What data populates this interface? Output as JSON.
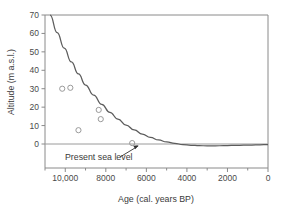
{
  "chart_data": {
    "type": "scatter",
    "title": "",
    "xlabel": "Age (cal. years BP)",
    "ylabel": "Altitude (m a.s.l.)",
    "xlim": [
      11000,
      0
    ],
    "ylim": [
      -8,
      70
    ],
    "x_reversed": true,
    "grid": false,
    "legend": null,
    "x_ticks": [
      10000,
      8000,
      6000,
      4000,
      2000,
      0
    ],
    "x_tick_labels": [
      "10,000",
      "8000",
      "6000",
      "4000",
      "2000",
      "0"
    ],
    "x_minor_ticks": [
      11000,
      9000,
      7000,
      5000,
      3000,
      1000
    ],
    "y_ticks": [
      0,
      10,
      20,
      30,
      40,
      50,
      60,
      70
    ],
    "y_tick_labels": [
      "0",
      "10",
      "20",
      "30",
      "40",
      "50",
      "60",
      "70"
    ],
    "series": [
      {
        "name": "Dated shoreline samples",
        "type": "scatter",
        "marker": "open-circle",
        "points": [
          {
            "x": 10150,
            "y": 30.0
          },
          {
            "x": 9750,
            "y": 30.5
          },
          {
            "x": 9350,
            "y": 7.5
          },
          {
            "x": 8350,
            "y": 18.5
          },
          {
            "x": 8250,
            "y": 13.5
          },
          {
            "x": 6700,
            "y": 0.5
          }
        ]
      },
      {
        "name": "Modelled relative sea-level curve",
        "type": "line",
        "points": [
          {
            "x": 10750,
            "y": 70.0
          },
          {
            "x": 10400,
            "y": 60.5
          },
          {
            "x": 10050,
            "y": 52.0
          },
          {
            "x": 9700,
            "y": 44.5
          },
          {
            "x": 9350,
            "y": 38.0
          },
          {
            "x": 9000,
            "y": 32.0
          },
          {
            "x": 8600,
            "y": 26.5
          },
          {
            "x": 8200,
            "y": 21.5
          },
          {
            "x": 7800,
            "y": 17.2
          },
          {
            "x": 7400,
            "y": 13.5
          },
          {
            "x": 7000,
            "y": 10.3
          },
          {
            "x": 6600,
            "y": 7.6
          },
          {
            "x": 6200,
            "y": 5.4
          },
          {
            "x": 5800,
            "y": 3.6
          },
          {
            "x": 5400,
            "y": 2.2
          },
          {
            "x": 5000,
            "y": 1.1
          },
          {
            "x": 4600,
            "y": 0.3
          },
          {
            "x": 4200,
            "y": -0.3
          },
          {
            "x": 3800,
            "y": -0.7
          },
          {
            "x": 3400,
            "y": -0.9
          },
          {
            "x": 3000,
            "y": -1.0
          },
          {
            "x": 2600,
            "y": -1.0
          },
          {
            "x": 2200,
            "y": -0.9
          },
          {
            "x": 1800,
            "y": -0.8
          },
          {
            "x": 1400,
            "y": -0.7
          },
          {
            "x": 1000,
            "y": -0.6
          },
          {
            "x": 600,
            "y": -0.5
          },
          {
            "x": 200,
            "y": -0.4
          },
          {
            "x": 0,
            "y": -0.4
          }
        ]
      },
      {
        "name": "Present sea level",
        "type": "reference-line",
        "y": 0
      }
    ],
    "annotations": [
      {
        "text": "Present sea level",
        "target_x": 6400,
        "target_y": 0
      }
    ]
  },
  "labels": {
    "x_axis_title": "Age (cal. years BP)",
    "y_axis_title": "Altitude (m a.s.l.)",
    "annotation_sea_level": "Present sea level"
  }
}
